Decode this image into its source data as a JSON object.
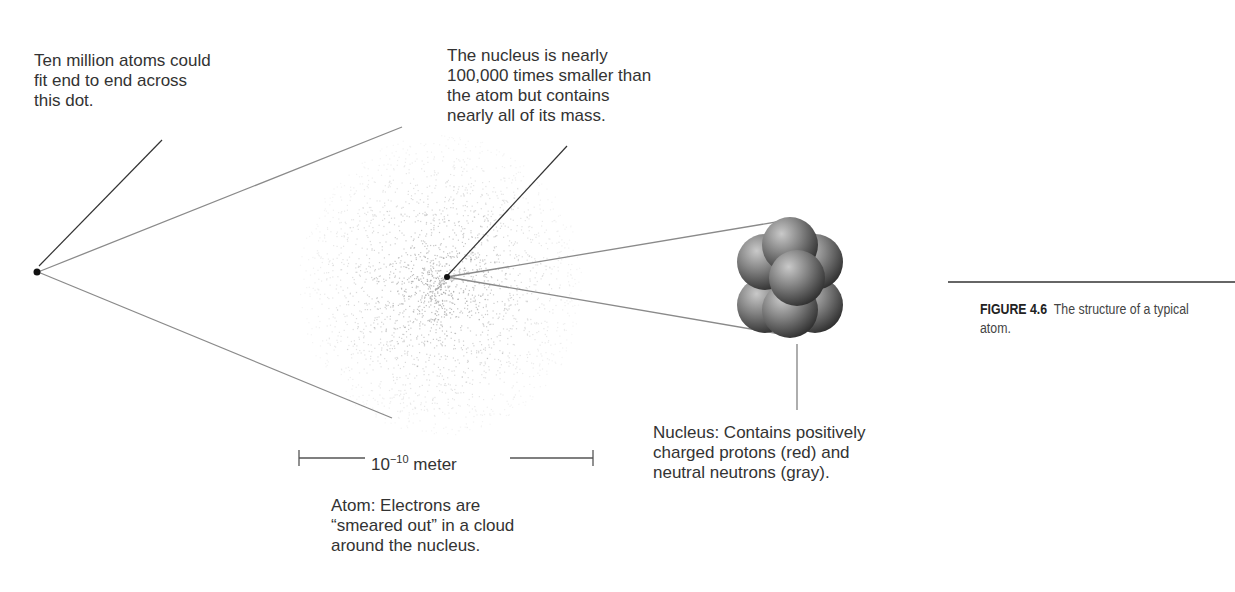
{
  "labels": {
    "dot": "Ten million atoms could\nfit end to end across\nthis dot.",
    "nucleus_size": "The nucleus is nearly\n100,000 times smaller than\nthe atom but contains\nnearly all of its mass.",
    "nucleus": "Nucleus: Contains positively\ncharged protons (red) and\nneutral neutrons (gray).",
    "atom": "Atom: Electrons are\n“smeared out” in a cloud\naround the nucleus."
  },
  "scale": {
    "base": "10",
    "exponent": "−10",
    "unit": "meter"
  },
  "caption": {
    "figure": "FIGURE 4.6",
    "text": "The structure of a typical atom."
  },
  "colors": {
    "line_gray": "#8a8a8a",
    "line_dark": "#333333",
    "cloud_dot": "#a8a8a8",
    "sphere_gray": "#7a7a7a"
  }
}
